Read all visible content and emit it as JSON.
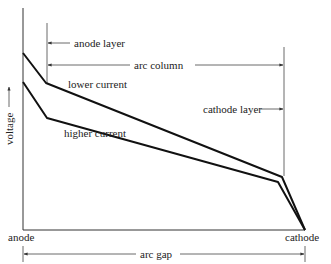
{
  "figure": {
    "type": "arc voltage distribution diagram",
    "y_axis_label": "voltage",
    "x_axis_label": "arc gap",
    "left_end_label": "anode",
    "right_end_label": "cathode",
    "regions": {
      "anode_layer": "anode layer",
      "arc_column": "arc column",
      "cathode_layer": "cathode layer"
    },
    "curves": [
      {
        "name": "lower current",
        "label": "lower current",
        "relative_voltage": "higher"
      },
      {
        "name": "higher current",
        "label": "higher current",
        "relative_voltage": "lower"
      }
    ],
    "colors": {
      "ink": "#111111",
      "thin_line": "#444444",
      "background": "#ffffff"
    }
  }
}
